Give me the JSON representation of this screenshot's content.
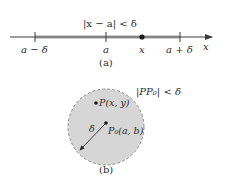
{
  "figure_a": {
    "inequality": "|x − a| < δ",
    "ticks": [
      {
        "label": "a − δ"
      },
      {
        "label": "a"
      },
      {
        "label": "x"
      },
      {
        "label": "a + δ"
      }
    ],
    "axis_label": "x",
    "caption": "(a)"
  },
  "figure_b": {
    "inequality": "|PP₀| < δ",
    "point_p": "P(x, y)",
    "point_p0": "P₀(a, b)",
    "radius_label": "δ",
    "caption": "(b)"
  },
  "colors": {
    "shade": "#cfcfcf",
    "line": "#3a3a3a",
    "circle_fill": "#d6d6d6",
    "circle_border": "#8a8a8a"
  }
}
